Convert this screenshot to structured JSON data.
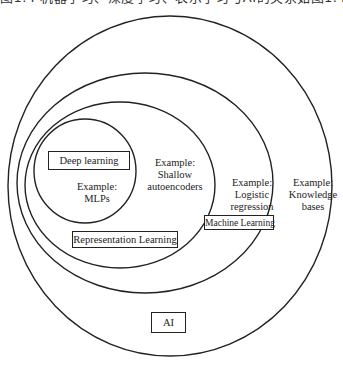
{
  "header": {
    "partial_text": "图1.4 机器学习、深度学习、表示学习与AI的关系如图1.4所示"
  },
  "diagram": {
    "type": "nested-venn",
    "sets": [
      {
        "id": "ai",
        "label": "AI",
        "example": "Example:\nKnowledge\nbases"
      },
      {
        "id": "ml",
        "label": "Machine Learning",
        "example": "Example:\nLogistic\nregression"
      },
      {
        "id": "rl",
        "label": "Representation Learning",
        "example": "Example:\nShallow\nautoencoders"
      },
      {
        "id": "dl",
        "label": "Deep learning",
        "example": "Example:\nMLPs"
      }
    ]
  },
  "labels": {
    "ai": "AI",
    "ai_example_1": "Example:",
    "ai_example_2": "Knowledge",
    "ai_example_3": "bases",
    "ml": "Machine Learning",
    "ml_example_1": "Example:",
    "ml_example_2": "Logistic",
    "ml_example_3": "regression",
    "rl": "Representation Learning",
    "rl_example_1": "Example:",
    "rl_example_2": "Shallow",
    "rl_example_3": "autoencoders",
    "dl": "Deep learning",
    "dl_example_1": "Example:",
    "dl_example_2": "MLPs"
  },
  "colors": {
    "stroke": "#222222",
    "background": "#ffffff"
  }
}
